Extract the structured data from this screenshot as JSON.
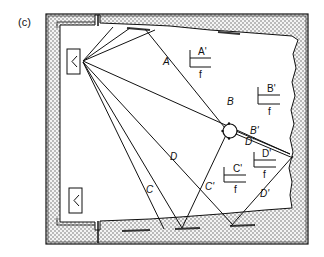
{
  "figure": {
    "panel_label": "(c)",
    "direct_rays": [
      "A",
      "B",
      "C",
      "D"
    ],
    "reflected_rays": [
      "A'",
      "B'",
      "C'",
      "D'"
    ],
    "ray_labels": {
      "A": "A",
      "B": "B",
      "C": "C",
      "D": "D",
      "A_prime": "A'",
      "B_prime": "B'",
      "C_prime": "C'",
      "D_prime_1": "D'",
      "D_prime_2": "D'",
      "C_prime_ray": "C'",
      "D_ray_2": "D"
    },
    "fraction_labels": [
      {
        "num": "A'",
        "den": "f"
      },
      {
        "num": "B'",
        "den": "f"
      },
      {
        "num": "C'",
        "den": "f"
      },
      {
        "num": "D'",
        "den": "f"
      }
    ],
    "colors": {
      "line": "#111111",
      "wall_fill": "#e6e6e6",
      "dot": "#555555",
      "background": "#ffffff"
    }
  }
}
